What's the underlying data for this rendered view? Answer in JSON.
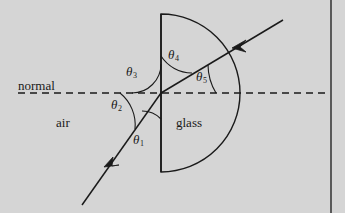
{
  "figure": {
    "background_color": "#d5d5d5",
    "ink_color": "#1a1a1a",
    "labels": {
      "normal": "normal",
      "air": "air",
      "glass": "glass"
    },
    "angles": [
      {
        "id": "theta1",
        "symbol": "θ",
        "subscript": "1"
      },
      {
        "id": "theta2",
        "symbol": "θ",
        "subscript": "2"
      },
      {
        "id": "theta3",
        "symbol": "θ",
        "subscript": "3"
      },
      {
        "id": "theta4",
        "symbol": "θ",
        "subscript": "4"
      },
      {
        "id": "theta5",
        "symbol": "θ",
        "subscript": "5"
      }
    ]
  }
}
